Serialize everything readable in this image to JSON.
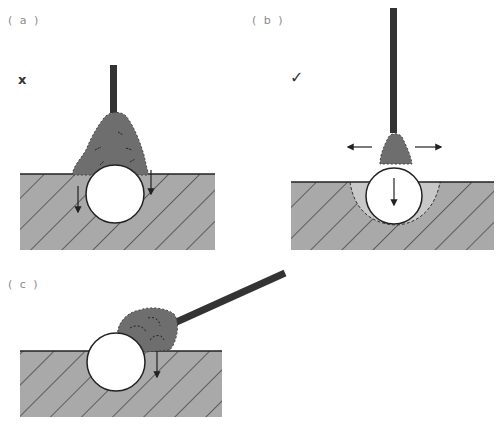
{
  "panels": [
    {
      "id": "a",
      "label": "( a )",
      "mark": "x",
      "mark_meaning": "incorrect",
      "description": "Vertical rod with large conical deposit piled over buried ball; downward arrows beside ball"
    },
    {
      "id": "b",
      "label": "( b )",
      "mark": "✓",
      "mark_meaning": "correct",
      "description": "Vertical rod with small deposit on ball; sideways arrows; ball sinking into softened region"
    },
    {
      "id": "c",
      "label": "( c )",
      "mark": "",
      "mark_meaning": "",
      "description": "Angled rod with deposit to side of ball; downward arrow on one side"
    }
  ],
  "colors": {
    "ground_fill": "#a9a9a9",
    "hatch": "#2a2a2a",
    "rod": "#333333",
    "deposit": "#6e6e6e",
    "softened_zone": "#c8c8c8",
    "ball": "#ffffff",
    "label_text": "#8a8a8a"
  }
}
